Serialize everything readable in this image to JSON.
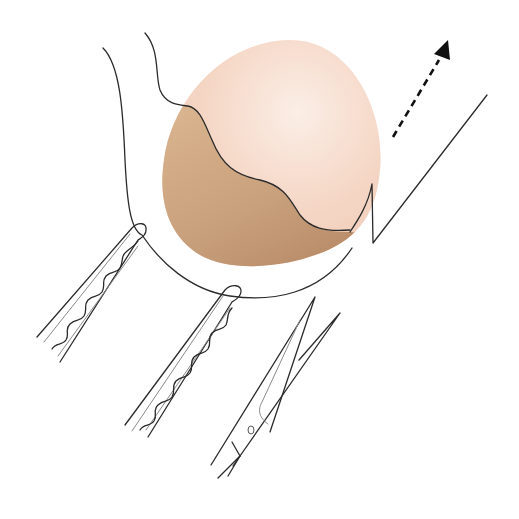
{
  "figure": {
    "colors": {
      "background": "#ffffff",
      "outline": "#2b2b2b",
      "mass_light": "#f7dccd",
      "mass_dark": "#c89a72",
      "arrow": "#111111"
    },
    "elements": {
      "mass": "egg-shaped mass",
      "tissue_outline": "tissue outline",
      "incision_line": "wavy incision line",
      "forceps_left": "left forceps",
      "forceps_right": "right forceps",
      "scissors": "scissors",
      "traction_arrow": "dashed traction arrow",
      "tissue_flap": "zigzag tissue flap"
    }
  }
}
